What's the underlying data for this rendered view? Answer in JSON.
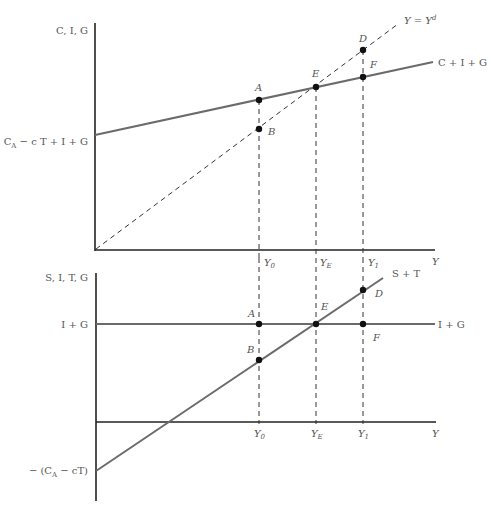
{
  "top_panel": {
    "y_axis_label": "C, I, G",
    "x_axis_label": "Y",
    "intercept_label": {
      "main": "C",
      "sub": "A",
      "rest": " − c T + I + G"
    },
    "curves": {
      "aggregate_demand": "C + I + G",
      "forty_five_line": {
        "main": "Y = Y",
        "sup": "d"
      }
    },
    "points": [
      "A",
      "B",
      "E",
      "D",
      "F"
    ],
    "x_ticks": [
      {
        "main": "Y",
        "sub": "0"
      },
      {
        "main": "Y",
        "sub": "E"
      },
      {
        "main": "Y",
        "sub": "1"
      }
    ]
  },
  "bottom_panel": {
    "y_axis_label": "S, I, T, G",
    "x_axis_label": "Y",
    "i_plus_g_left_label": "I + G",
    "intercept_label": {
      "pre": "− (C",
      "sub": "A",
      "rest": " − cT)"
    },
    "curves": {
      "savings_taxes": "S + T",
      "injections": "I + G"
    },
    "points": [
      "A",
      "B",
      "E",
      "D",
      "F"
    ],
    "x_ticks": [
      {
        "main": "Y",
        "sub": "0"
      },
      {
        "main": "Y",
        "sub": "E"
      },
      {
        "main": "Y",
        "sub": "1"
      }
    ]
  },
  "colors": {
    "axis": "#222222",
    "curve": "#6b6b6b",
    "dashed": "#333333",
    "point": "#111111",
    "text": "#555555"
  }
}
